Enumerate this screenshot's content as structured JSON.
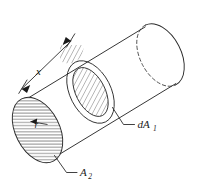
{
  "figure": {
    "type": "technical-line-drawing",
    "background_color": "#ffffff",
    "line_color": "#2b2b2b",
    "hatch_color": "#3a3a3a",
    "labels": {
      "length_dimension": "x",
      "radius": "r",
      "differential_area": "dA",
      "differential_area_subscript": "1",
      "end_area": "A",
      "end_area_subscript": "2"
    },
    "elements": {
      "cylinder": "cylinder-body",
      "near_end_cap": "left-elliptical-face-hatched",
      "far_end_cap": "right-elliptical-face",
      "hidden_edge": "dashed-far-rim",
      "ring_band": "annular-strip-hatched",
      "dimension_line": "length-dimension-with-arrowheads",
      "radius_arrow": "radius-arrow",
      "leader_dA1": "leader-line-to-ring",
      "leader_A2": "leader-line-to-end-face"
    }
  }
}
